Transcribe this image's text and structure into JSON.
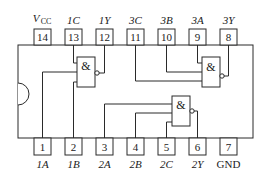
{
  "diagram": {
    "type": "ic-pinout",
    "gate_symbol": "&",
    "top_pins": [
      {
        "number": "14",
        "label": "V",
        "sub": "CC",
        "italic": true
      },
      {
        "number": "13",
        "label": "1C"
      },
      {
        "number": "12",
        "label": "1Y"
      },
      {
        "number": "11",
        "label": "3C"
      },
      {
        "number": "10",
        "label": "3B"
      },
      {
        "number": "9",
        "label": "3A"
      },
      {
        "number": "8",
        "label": "3Y"
      }
    ],
    "bottom_pins": [
      {
        "number": "1",
        "label": "1A"
      },
      {
        "number": "2",
        "label": "1B"
      },
      {
        "number": "3",
        "label": "2A"
      },
      {
        "number": "4",
        "label": "2B"
      },
      {
        "number": "5",
        "label": "2C"
      },
      {
        "number": "6",
        "label": "2Y"
      },
      {
        "number": "7",
        "label": "GND"
      }
    ],
    "gates": [
      {
        "name": "gate-1",
        "inputs": [
          "1C",
          "1A",
          "1B"
        ],
        "output": "1Y",
        "symbol": "&"
      },
      {
        "name": "gate-2",
        "inputs": [
          "2A",
          "2B",
          "2C"
        ],
        "output": "2Y",
        "symbol": "&"
      },
      {
        "name": "gate-3",
        "inputs": [
          "3A",
          "3B",
          "3C"
        ],
        "output": "3Y",
        "symbol": "&"
      }
    ]
  }
}
